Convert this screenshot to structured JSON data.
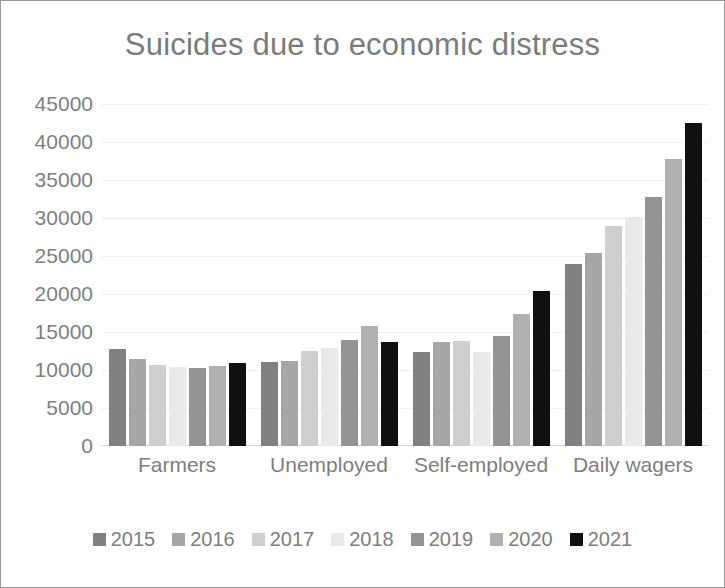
{
  "chart_data": {
    "type": "bar",
    "title": "Suicides due to economic distress",
    "xlabel": "",
    "ylabel": "",
    "ylim": [
      0,
      45000
    ],
    "ytick_step": 5000,
    "yticks": [
      "45000",
      "40000",
      "35000",
      "30000",
      "25000",
      "20000",
      "15000",
      "10000",
      "5000",
      "0"
    ],
    "grid": true,
    "legend_position": "bottom",
    "categories": [
      "Farmers",
      "Unemployed",
      "Self-employed",
      "Daily wagers"
    ],
    "series": [
      {
        "name": "2015",
        "color": "#808080",
        "values": [
          12750,
          11000,
          12350,
          24000
        ]
      },
      {
        "name": "2016",
        "color": "#a6a6a6",
        "values": [
          11400,
          11200,
          13750,
          25400
        ]
      },
      {
        "name": "2017",
        "color": "#cfcfcf",
        "values": [
          10650,
          12500,
          13800,
          28900
        ]
      },
      {
        "name": "2018",
        "color": "#e9e9e9",
        "values": [
          10450,
          12900,
          12400,
          30150
        ]
      },
      {
        "name": "2019",
        "color": "#949494",
        "values": [
          10200,
          14000,
          14500,
          32800
        ]
      },
      {
        "name": "2020",
        "color": "#b0b0b0",
        "values": [
          10550,
          15750,
          17350,
          37800
        ]
      },
      {
        "name": "2021",
        "color": "#101010",
        "values": [
          10900,
          13700,
          20400,
          42500
        ]
      }
    ],
    "colors": {
      "title": "#7b7b7b",
      "tick_label": "#808080",
      "gridline": "#efefef",
      "frame_border": "#9a9a9a",
      "plot_background": "#ffffff"
    }
  }
}
